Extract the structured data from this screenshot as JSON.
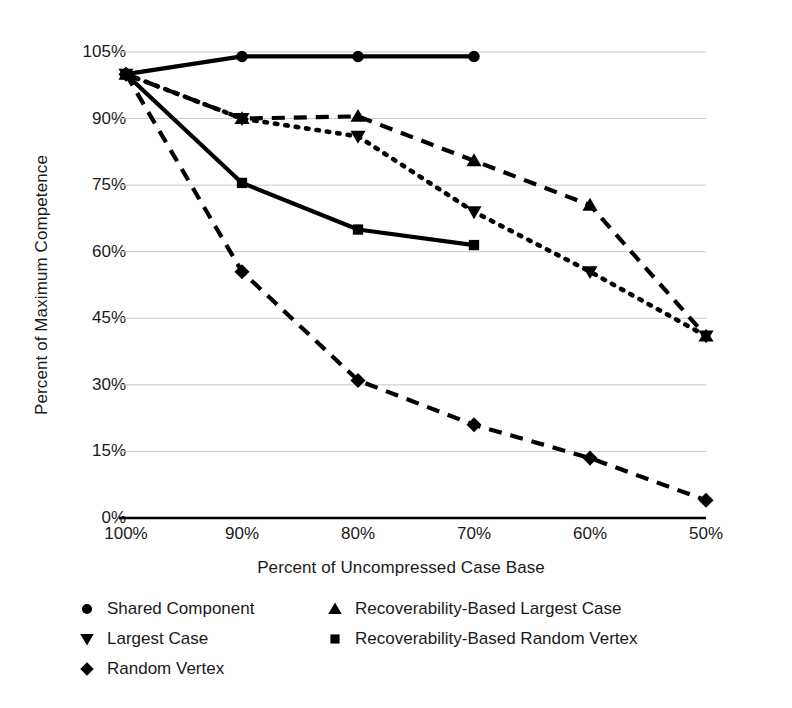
{
  "chart_data": {
    "type": "line",
    "title": "",
    "xlabel": "Percent of Uncompressed Case Base",
    "ylabel": "Percent of Maximum Competence",
    "categories": [
      "100%",
      "90%",
      "80%",
      "70%",
      "60%",
      "50%"
    ],
    "x_values": [
      100,
      90,
      80,
      70,
      60,
      50
    ],
    "ylim": [
      0,
      105
    ],
    "yticks": [
      "0%",
      "15%",
      "30%",
      "45%",
      "60%",
      "75%",
      "90%",
      "105%"
    ],
    "ytick_values": [
      0,
      15,
      30,
      45,
      60,
      75,
      90,
      105
    ],
    "grid": true,
    "legend_position": "bottom",
    "series": [
      {
        "name": "Shared Component",
        "marker": "circle",
        "linestyle": "solid",
        "values": [
          100,
          104,
          104,
          104,
          null,
          null
        ]
      },
      {
        "name": "Largest Case",
        "marker": "triangle-down",
        "linestyle": "dotted",
        "values": [
          100,
          90,
          86,
          69,
          55.5,
          41
        ]
      },
      {
        "name": "Random Vertex",
        "marker": "diamond",
        "linestyle": "dashed",
        "values": [
          100,
          55.5,
          31,
          21,
          13.5,
          4
        ]
      },
      {
        "name": "Recoverability-Based Largest Case",
        "marker": "triangle-up",
        "linestyle": "dashed",
        "values": [
          100,
          90,
          90.5,
          80.5,
          70.5,
          41
        ]
      },
      {
        "name": "Recoverability-Based Random Vertex",
        "marker": "square",
        "linestyle": "solid",
        "values": [
          100,
          75.5,
          65,
          61.5,
          null,
          null
        ]
      }
    ]
  },
  "legend": {
    "items": [
      {
        "label": "Shared Component",
        "marker": "circle-icon"
      },
      {
        "label": "Recoverability-Based Largest Case",
        "marker": "triangle-up-icon"
      },
      {
        "label": "Largest Case",
        "marker": "triangle-down-icon"
      },
      {
        "label": "Recoverability-Based Random Vertex",
        "marker": "square-icon"
      },
      {
        "label": "Random Vertex",
        "marker": "diamond-icon"
      }
    ]
  },
  "colors": {
    "ink": "#000000",
    "grid": "#c8c8c8",
    "axis": "#000000",
    "background": "#ffffff"
  }
}
